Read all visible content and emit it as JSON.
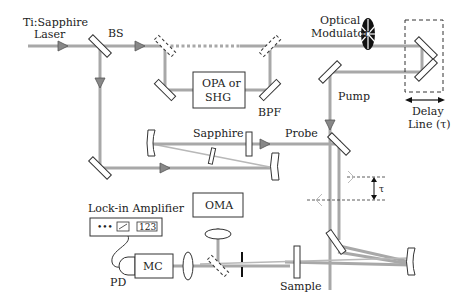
{
  "diagram": {
    "type": "optical-setup",
    "labels": {
      "laser": [
        "Ti:Sapphire",
        "Laser"
      ],
      "beam_splitter": "BS",
      "opa": [
        "OPA or",
        "SHG"
      ],
      "bpf": "BPF",
      "modulator": [
        "Optical",
        "Modulator"
      ],
      "pump": "Pump",
      "delay_line": [
        "Delay",
        "Line (τ)"
      ],
      "sapphire": "Sapphire",
      "probe": "Probe",
      "tau": "τ",
      "lockin": "Lock-in Amplifier",
      "lockin_display": "123",
      "lockin_dots": "•••",
      "oma": "OMA",
      "mc": "MC",
      "pd": "PD",
      "sample": "Sample"
    },
    "colors": {
      "beam": "#a8a8a8",
      "outline": "#333333",
      "text": "#222222",
      "background": "#ffffff"
    }
  }
}
